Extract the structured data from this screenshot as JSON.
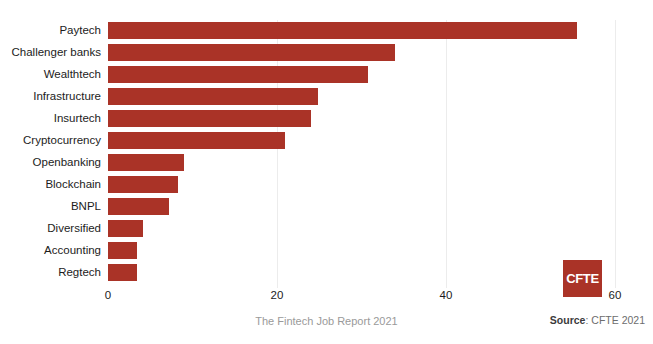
{
  "chart_data": {
    "type": "bar",
    "orientation": "horizontal",
    "title": "",
    "xlabel": "",
    "ylabel": "",
    "xlim": [
      0,
      60
    ],
    "xticks": [
      0,
      20,
      40,
      60
    ],
    "xtick_labels": [
      "0",
      "20",
      "40",
      "60"
    ],
    "grid": true,
    "legend": "none",
    "bar_color": "#aa3327",
    "categories": [
      "Paytech",
      "Challenger banks",
      "Wealthtech",
      "Infrastructure",
      "Insurtech",
      "Cryptocurrency",
      "Openbanking",
      "Blockchain",
      "BNPL",
      "Diversified",
      "Accounting",
      "Regtech"
    ],
    "values": [
      55.5,
      34,
      30.8,
      24.9,
      24,
      21,
      9,
      8.3,
      7.2,
      4.1,
      3.4,
      3.4
    ]
  },
  "footer": {
    "caption": "The Fintech Job Report 2021",
    "source_label": "Source",
    "source_separator": ": ",
    "source_value": "CFTE 2021"
  },
  "logo": {
    "text": "CFTE"
  }
}
